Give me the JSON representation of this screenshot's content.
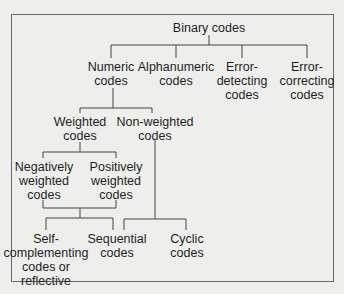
{
  "diagram": {
    "root": {
      "label": [
        "Binary codes"
      ]
    },
    "level1": [
      {
        "id": "numeric",
        "label": [
          "Numeric",
          "codes"
        ]
      },
      {
        "id": "alphanumeric",
        "label": [
          "Alphanumeric",
          "codes"
        ]
      },
      {
        "id": "error-detecting",
        "label": [
          "Error-",
          "detecting",
          "codes"
        ]
      },
      {
        "id": "error-correcting",
        "label": [
          "Error-",
          "correcting",
          "codes"
        ]
      }
    ],
    "level2": [
      {
        "id": "weighted",
        "parent": "numeric",
        "label": [
          "Weighted",
          "codes"
        ]
      },
      {
        "id": "non-weighted",
        "parent": "numeric",
        "label": [
          "Non-weighted",
          "codes"
        ]
      }
    ],
    "level3": [
      {
        "id": "negatively-weighted",
        "parent": "weighted",
        "label": [
          "Negatively",
          "weighted",
          "codes"
        ]
      },
      {
        "id": "positively-weighted",
        "parent": "weighted",
        "label": [
          "Positively",
          "weighted",
          "codes"
        ]
      }
    ],
    "level4": [
      {
        "id": "self-complementing",
        "parent": "weighted-group",
        "label": [
          "Self-",
          "complementing",
          "codes or",
          "reflective"
        ]
      },
      {
        "id": "sequential",
        "parent": "weighted-group+non-weighted",
        "label": [
          "Sequential",
          "codes"
        ]
      },
      {
        "id": "cyclic",
        "parent": "non-weighted",
        "label": [
          "Cyclic",
          "codes"
        ]
      }
    ]
  },
  "colors": {
    "background": "#eeeeec",
    "line": "#444444",
    "text": "#1e1e1e",
    "frame": "#6a6a6a"
  }
}
